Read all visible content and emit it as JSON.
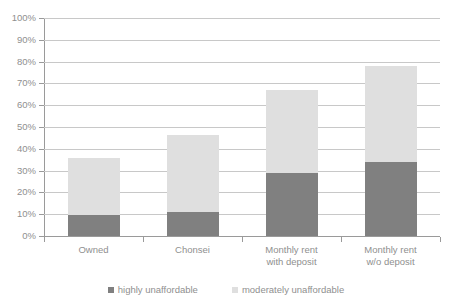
{
  "chart_data": {
    "type": "bar",
    "stacked": true,
    "title": "",
    "subtitle": "",
    "xlabel": "",
    "ylabel": "",
    "ylim": [
      0,
      100
    ],
    "ytick_labels": [
      "100%",
      "90%",
      "80%",
      "70%",
      "60%",
      "50%",
      "40%",
      "30%",
      "20%",
      "10%",
      "0%"
    ],
    "ytick_values": [
      100,
      90,
      80,
      70,
      60,
      50,
      40,
      30,
      20,
      10,
      0
    ],
    "grid": true,
    "legend_position": "bottom",
    "categories": [
      "Owned",
      "Chonsei",
      "Monthly rent\nwith deposit",
      "Monthly rent\nw/o deposit"
    ],
    "series": [
      {
        "name": "highly unaffordable",
        "color": "#808080",
        "values": [
          9.8,
          11.2,
          28.9,
          34.0
        ]
      },
      {
        "name": "moderately unaffordable",
        "color": "#dfdfdf",
        "values": [
          25.8,
          35.0,
          38.3,
          44.0
        ]
      }
    ],
    "totals": [
      35.6,
      46.2,
      67.2,
      78.0
    ]
  },
  "legend": {
    "entries": [
      {
        "label": "highly unaffordable",
        "color": "#808080"
      },
      {
        "label": "moderately unaffordable",
        "color": "#dfdfdf"
      }
    ]
  },
  "colors": {
    "gridline": "#c8c8c8",
    "axis": "#9a9a9a",
    "text": "#8f8f8f",
    "background": "#ffffff"
  }
}
